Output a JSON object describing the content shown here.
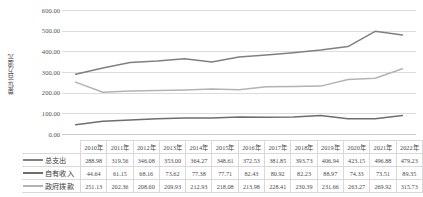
{
  "chart_data": {
    "type": "line",
    "title": "",
    "xlabel": "",
    "ylabel": "单位/百万澳元",
    "ylim": [
      0,
      600
    ],
    "ytick_step": 100,
    "ytick_labels": [
      "600.00",
      "500.00",
      "400.00",
      "300.00",
      "200.00",
      "100.00",
      "0.00"
    ],
    "grid": true,
    "legend_position": "table-left",
    "categories": [
      "2010年",
      "2011年",
      "2012年",
      "2013年",
      "2014年",
      "2015年",
      "2016年",
      "2017年",
      "2018年",
      "2019年",
      "2020年",
      "2021年",
      "2022年"
    ],
    "series": [
      {
        "name": "总支出",
        "color": "#808080",
        "values": [
          288.98,
          319.56,
          346.08,
          353.0,
          364.27,
          348.61,
          372.53,
          381.85,
          393.73,
          406.94,
          423.15,
          496.88,
          479.23
        ],
        "labels": [
          "288.98",
          "319.56",
          "346.08",
          "353.00",
          "364.27",
          "348.61",
          "372.53",
          "381.85",
          "393.73",
          "406.94",
          "423.15",
          "496.88",
          "479.23"
        ]
      },
      {
        "name": "自有收入",
        "color": "#6e6e6e",
        "values": [
          44.64,
          61.15,
          68.16,
          73.62,
          77.38,
          77.71,
          82.43,
          80.92,
          82.23,
          88.97,
          74.33,
          73.51,
          89.35
        ],
        "labels": [
          "44.64",
          "61.15",
          "68.16",
          "73.62",
          "77.38",
          "77.71",
          "82.43",
          "80.92",
          "82.23",
          "88.97",
          "74.33",
          "73.51",
          "89.35"
        ]
      },
      {
        "name": "政府拨款",
        "color": "#b3b3b3",
        "values": [
          251.13,
          202.36,
          208.6,
          209.93,
          212.93,
          218.08,
          213.98,
          228.41,
          230.39,
          231.66,
          263.27,
          269.92,
          315.73
        ],
        "labels": [
          "251.13",
          "202.36",
          "208.60",
          "209.93",
          "212.93",
          "218.08",
          "213.98",
          "228.41",
          "230.39",
          "231.66",
          "263.27",
          "269.92",
          "315.73"
        ]
      }
    ]
  },
  "table": {
    "corner_label": ""
  }
}
